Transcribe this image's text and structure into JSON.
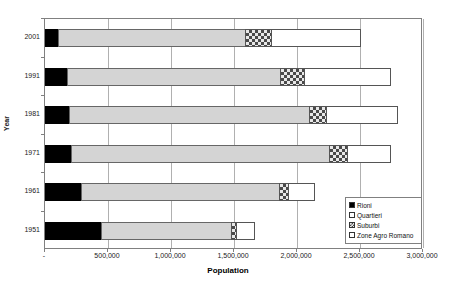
{
  "chart_data": {
    "type": "bar",
    "orientation": "horizontal",
    "stacked": true,
    "title": "",
    "xlabel": "Population",
    "ylabel": "Year",
    "xlim": [
      0,
      3000000
    ],
    "xticks": [
      0,
      500000,
      1000000,
      1500000,
      2000000,
      2500000,
      3000000
    ],
    "xtick_labels": [
      "-",
      "500,000",
      "1,000,000",
      "1,500,000",
      "2,000,000",
      "2,500,000",
      "3,000,000"
    ],
    "categories": [
      "2001",
      "1991",
      "1981",
      "1971",
      "1961",
      "1951"
    ],
    "category_order_top_to_bottom": [
      "2001",
      "1991",
      "1981",
      "1971",
      "1961",
      "1951"
    ],
    "grid": "vertical",
    "legend_position": "bottom-right",
    "series": [
      {
        "name": "Rioni",
        "fill": "solid-black",
        "values": [
          110000,
          180000,
          200000,
          215000,
          295000,
          450000
        ]
      },
      {
        "name": "Quartieri",
        "fill": "light-gray",
        "values": [
          1490000,
          1700000,
          1910000,
          2055000,
          1580000,
          1040000
        ]
      },
      {
        "name": "Suburbi",
        "fill": "checkered",
        "values": [
          215000,
          200000,
          145000,
          150000,
          80000,
          50000
        ]
      },
      {
        "name": "Zone Agro Romano",
        "fill": "white",
        "values": [
          720000,
          690000,
          570000,
          350000,
          215000,
          150000
        ]
      }
    ],
    "totals": [
      2535000,
      2770000,
      2825000,
      2770000,
      2170000,
      1690000
    ]
  },
  "legend": {
    "items": [
      {
        "label": "Rioni"
      },
      {
        "label": "Quartieri"
      },
      {
        "label": "Suburbi"
      },
      {
        "label": "Zone Agro Romano"
      }
    ]
  },
  "axes": {
    "x_title": "Population",
    "y_title": "Year"
  },
  "colors": {
    "rioni": "#000000",
    "quartieri": "#d4d4d4",
    "suburbi": "#e8e8e8",
    "zone": "#ffffff",
    "grid": "#b0b0b0",
    "frame": "#808080"
  }
}
